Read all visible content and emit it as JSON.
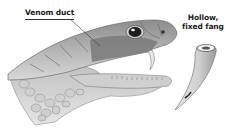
{
  "diagram": {
    "labels": {
      "venom_duct": "Venom duct",
      "fang_line1": "Hollow,",
      "fang_line2": "fixed fang"
    },
    "colors": {
      "background": "#ffffff",
      "scale_light": "#d9d9d9",
      "scale_mid": "#a6a6a6",
      "scale_dark": "#6e6e6e",
      "venom_gland": "#7a7a7a",
      "eye": "#1e1e1e",
      "text": "#1a1a1a"
    }
  }
}
